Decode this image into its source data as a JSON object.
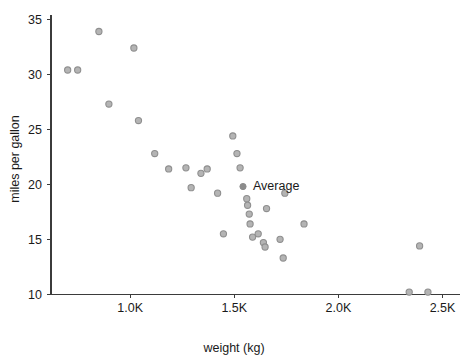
{
  "chart_data": {
    "type": "scatter",
    "title": "",
    "xlabel": "weight (kg)",
    "ylabel": "miles per gallon",
    "xlim": [
      620,
      2560
    ],
    "ylim": [
      9.3,
      35.4
    ],
    "grid": false,
    "legend": "none",
    "xticks": [
      {
        "value": 1000,
        "label": "1.0K"
      },
      {
        "value": 1500,
        "label": "1.5K"
      },
      {
        "value": 2000,
        "label": "2.0K"
      },
      {
        "value": 2500,
        "label": "2.5K"
      }
    ],
    "yticks": [
      {
        "value": 10,
        "label": "10"
      },
      {
        "value": 15,
        "label": "15"
      },
      {
        "value": 20,
        "label": "20"
      },
      {
        "value": 25,
        "label": "25"
      },
      {
        "value": 30,
        "label": "30"
      },
      {
        "value": 35,
        "label": "35"
      }
    ],
    "series": [
      {
        "name": "cars",
        "marker": "open-circle",
        "color": "#b4b4b4",
        "points": [
          {
            "x": 700,
            "y": 30.4
          },
          {
            "x": 748,
            "y": 30.4
          },
          {
            "x": 850,
            "y": 33.9
          },
          {
            "x": 898,
            "y": 27.3
          },
          {
            "x": 1018,
            "y": 32.4
          },
          {
            "x": 1040,
            "y": 25.8
          },
          {
            "x": 1118,
            "y": 22.8
          },
          {
            "x": 1185,
            "y": 21.4
          },
          {
            "x": 1268,
            "y": 21.5
          },
          {
            "x": 1293,
            "y": 19.7
          },
          {
            "x": 1340,
            "y": 21.0
          },
          {
            "x": 1370,
            "y": 21.4
          },
          {
            "x": 1420,
            "y": 19.2
          },
          {
            "x": 1448,
            "y": 15.5
          },
          {
            "x": 1493,
            "y": 24.4
          },
          {
            "x": 1513,
            "y": 22.8
          },
          {
            "x": 1528,
            "y": 21.5
          },
          {
            "x": 1560,
            "y": 18.7
          },
          {
            "x": 1564,
            "y": 18.1
          },
          {
            "x": 1572,
            "y": 17.3
          },
          {
            "x": 1576,
            "y": 16.4
          },
          {
            "x": 1588,
            "y": 15.2
          },
          {
            "x": 1615,
            "y": 15.5
          },
          {
            "x": 1640,
            "y": 14.7
          },
          {
            "x": 1648,
            "y": 14.3
          },
          {
            "x": 1655,
            "y": 17.8
          },
          {
            "x": 1720,
            "y": 15.0
          },
          {
            "x": 1735,
            "y": 13.3
          },
          {
            "x": 1743,
            "y": 19.2
          },
          {
            "x": 1835,
            "y": 16.4
          },
          {
            "x": 2390,
            "y": 14.4
          },
          {
            "x": 2340,
            "y": 10.2
          },
          {
            "x": 2430,
            "y": 10.2
          }
        ]
      },
      {
        "name": "Average",
        "marker": "filled-circle",
        "color": "#8c8c8c",
        "points": [
          {
            "x": 1542,
            "y": 19.8
          }
        ]
      }
    ],
    "annotations": [
      {
        "text": "Average",
        "x": 1542,
        "y": 19.8,
        "dx": 10,
        "dy": 3
      }
    ]
  }
}
